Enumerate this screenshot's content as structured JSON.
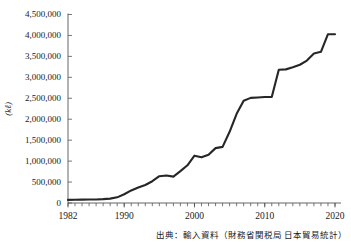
{
  "chart_data": {
    "type": "line",
    "title": "",
    "xlabel": "",
    "ylabel": "(kℓ)",
    "ylabel_unit": "(kℓ)",
    "xlim": [
      1982,
      2020
    ],
    "ylim": [
      0,
      4500000
    ],
    "grid": false,
    "legend": false,
    "y_ticks": [
      0,
      500000,
      1000000,
      1500000,
      2000000,
      2500000,
      3000000,
      3500000,
      4000000,
      4500000
    ],
    "y_tick_labels": [
      "0",
      "500,000",
      "1,000,000",
      "1,500,000",
      "2,000,000",
      "2,500,000",
      "3,000,000",
      "3,500,000",
      "4,000,000",
      "4,500,000"
    ],
    "x_ticks": [
      1982,
      1990,
      2000,
      2010,
      2020
    ],
    "x_tick_labels": [
      "1982",
      "1990",
      "2000",
      "2010",
      "2020"
    ],
    "x_minor_tick_interval": 1,
    "series": [
      {
        "name": "輸入量",
        "color": "#262626",
        "x": [
          1982,
          1983,
          1984,
          1985,
          1986,
          1987,
          1988,
          1989,
          1990,
          1991,
          1992,
          1993,
          1994,
          1995,
          1996,
          1997,
          1998,
          1999,
          2000,
          2001,
          2002,
          2003,
          2004,
          2005,
          2006,
          2007,
          2008,
          2009,
          2010,
          2011,
          2012,
          2013,
          2014,
          2015,
          2016,
          2017,
          2018,
          2019,
          2020
        ],
        "values": [
          75000,
          78000,
          80000,
          82000,
          85000,
          92000,
          105000,
          135000,
          210000,
          300000,
          370000,
          430000,
          520000,
          640000,
          655000,
          630000,
          760000,
          900000,
          1130000,
          1090000,
          1150000,
          1310000,
          1340000,
          1700000,
          2130000,
          2440000,
          2510000,
          2520000,
          2530000,
          2530000,
          3180000,
          3190000,
          3240000,
          3300000,
          3400000,
          3570000,
          3610000,
          4030000,
          4030000
        ]
      }
    ],
    "annotations": [],
    "source_note": "出典：輸入資料（財務省関税局 日本貿易統計）"
  },
  "figure": {
    "axis_color": "#555555",
    "line_color": "#262626",
    "background": "#ffffff",
    "y_axis_unit_label": "(kℓ)",
    "source_label": "出典：輸入資料（財務省関税局 日本貿易統計）"
  }
}
